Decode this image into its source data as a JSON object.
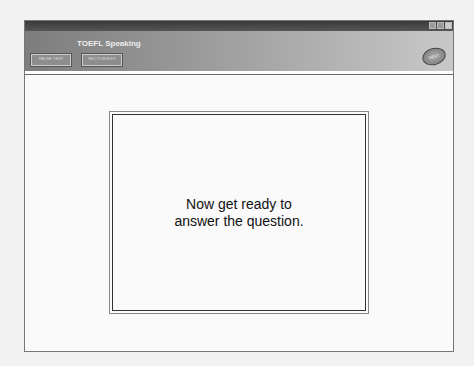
{
  "header": {
    "title": "TOEFL Speaking",
    "buttons": [
      {
        "label": "PAUSE TEST"
      },
      {
        "label": "SECTION EXIT"
      }
    ],
    "next_label": "NEXT"
  },
  "main": {
    "message_line1": "Now get ready to",
    "message_line2": "answer the question."
  }
}
